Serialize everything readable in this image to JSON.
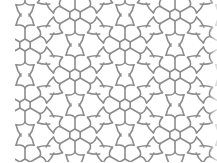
{
  "image": {
    "description": "Geometric line-art tessellation pattern: hexagonal rosettes with six radiating spokes linked by curved four-lobed star/diamond shapes",
    "caption": "Geometric rosette tiling pattern"
  },
  "style": {
    "background": "#ffffff",
    "stroke": "#8c8c8c",
    "stroke_width": 1.6
  },
  "pattern": {
    "rosette_hex_radius": 6,
    "spoke_length": 11,
    "row_spacing": 30,
    "column_spacing": 100,
    "row_offsets": [
      25,
      75
    ],
    "rosette_centers": [
      [
        75,
        15
      ],
      [
        175,
        15
      ],
      [
        25,
        45
      ],
      [
        125,
        45
      ],
      [
        75,
        75
      ],
      [
        175,
        75
      ],
      [
        25,
        105
      ],
      [
        125,
        105
      ],
      [
        75,
        135
      ],
      [
        175,
        135
      ]
    ]
  }
}
